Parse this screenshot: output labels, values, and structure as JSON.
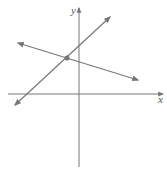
{
  "diagram": {
    "type": "coordinate-plane-two-lines",
    "axes": {
      "x_label": "x",
      "y_label": "y",
      "color": "#777777"
    },
    "lines": [
      {
        "name": "rising-line",
        "x1": 15,
        "y1": 105,
        "x2": 110,
        "y2": 17,
        "color": "#777777"
      },
      {
        "name": "falling-line",
        "x1": 18,
        "y1": 43,
        "x2": 138,
        "y2": 80,
        "color": "#777777"
      }
    ],
    "intersection": {
      "cx": 67,
      "cy": 58,
      "color": "#777777"
    }
  }
}
